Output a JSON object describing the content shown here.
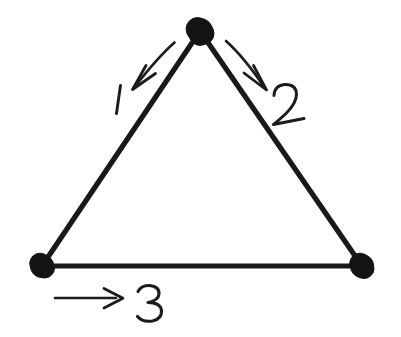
{
  "canvas": {
    "width": 401,
    "height": 337,
    "background_color": "#ffffff",
    "ink_color": "#191919",
    "style": "hand-drawn-ink-sketch"
  },
  "figure": {
    "title": "Triangle with three directed edges",
    "shape": "triangle",
    "node_count": 3,
    "edge_count": 3
  },
  "nodes": [
    {
      "id": "apex",
      "label": "",
      "cx": 200,
      "cy": 31,
      "r": 12.5,
      "color": "#141414"
    },
    {
      "id": "bottom-left",
      "label": "",
      "cx": 42,
      "cy": 266,
      "r": 11.5,
      "color": "#141414"
    },
    {
      "id": "bottom-right",
      "label": "",
      "cx": 362,
      "cy": 266,
      "r": 11.5,
      "color": "#141414"
    }
  ],
  "edges": [
    {
      "id": "edge-1",
      "label": "1",
      "from": "apex",
      "to": "bottom-left",
      "x1": 200,
      "y1": 31,
      "x2": 42,
      "y2": 266,
      "direction": "down-left",
      "label_x": 119,
      "label_y": 100
    },
    {
      "id": "edge-2",
      "label": "2",
      "from": "apex",
      "to": "bottom-right",
      "x1": 200,
      "y1": 31,
      "x2": 362,
      "y2": 266,
      "direction": "down-right",
      "label_x": 288,
      "label_y": 104
    },
    {
      "id": "edge-3",
      "label": "3",
      "from": "bottom-left",
      "to": "bottom-right",
      "x1": 42,
      "y1": 266,
      "x2": 362,
      "y2": 266,
      "direction": "right",
      "label_x": 149,
      "label_y": 302
    }
  ],
  "arrows": [
    {
      "id": "arrow-1",
      "for_edge": "edge-1",
      "tail_x": 174,
      "tail_y": 42,
      "tip_x": 133,
      "tip_y": 89,
      "points": "down-left"
    },
    {
      "id": "arrow-2",
      "for_edge": "edge-2",
      "tail_x": 227,
      "tail_y": 41,
      "tip_x": 266,
      "tip_y": 89,
      "points": "down-right"
    },
    {
      "id": "arrow-3",
      "for_edge": "edge-3",
      "tail_x": 55,
      "tail_y": 298,
      "tip_x": 123,
      "tip_y": 298,
      "points": "right"
    }
  ],
  "labels": {
    "edge_1": "1",
    "edge_2": "2",
    "edge_3": "3"
  }
}
